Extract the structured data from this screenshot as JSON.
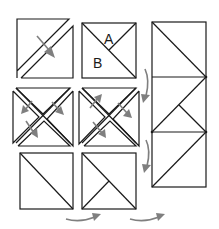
{
  "diagram": {
    "labels": {
      "a": "A",
      "b": "B"
    },
    "colors": {
      "line": "#1a1a1a",
      "arrow": "#7f7f7f",
      "background": "#ffffff"
    },
    "steps": [
      {
        "id": "cut-diagonal-square",
        "description": "Square cut along diagonal, pieces separated"
      },
      {
        "id": "labeled-square",
        "description": "Square divided into triangle A and triangle B"
      },
      {
        "id": "quarter-cut-square-1",
        "description": "Square cut on both diagonals, pieces separated"
      },
      {
        "id": "quarter-cut-square-2",
        "description": "Square cut on both diagonals, pieces separated"
      },
      {
        "id": "half-square-triangle",
        "description": "Half-square triangle unit"
      },
      {
        "id": "hourglass-half",
        "description": "Half-square with quarter triangles"
      },
      {
        "id": "assembled-column",
        "description": "Three units assembled vertically"
      }
    ]
  }
}
